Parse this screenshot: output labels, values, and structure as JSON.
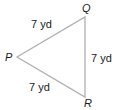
{
  "diagram": {
    "type": "triangle",
    "stroke_color": "#b0b0b0",
    "vertices": [
      {
        "name": "P",
        "x": 17,
        "y": 57
      },
      {
        "name": "Q",
        "x": 85,
        "y": 17
      },
      {
        "name": "R",
        "x": 85,
        "y": 97
      }
    ],
    "sides": [
      {
        "from": "P",
        "to": "Q",
        "label": "7 yd"
      },
      {
        "from": "Q",
        "to": "R",
        "label": "7 yd"
      },
      {
        "from": "P",
        "to": "R",
        "label": "7 yd"
      }
    ],
    "vertex_labels": {
      "P": "P",
      "Q": "Q",
      "R": "R"
    }
  }
}
